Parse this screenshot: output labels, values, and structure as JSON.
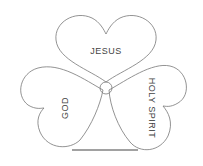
{
  "diagram": {
    "type": "shamrock",
    "leaves": [
      {
        "label": "JESUS",
        "position": "top"
      },
      {
        "label": "GOD",
        "position": "left"
      },
      {
        "label": "HOLY SPIRIT",
        "position": "right"
      }
    ],
    "center": "circle",
    "stem": "line"
  }
}
